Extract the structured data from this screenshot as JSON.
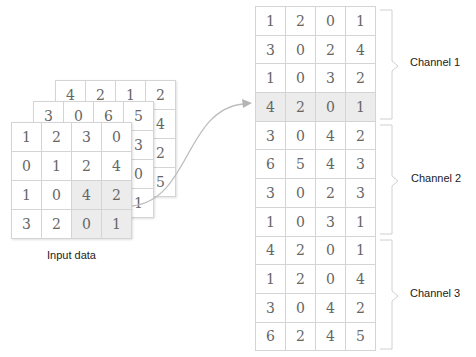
{
  "input": {
    "caption": "Input data",
    "layers": [
      {
        "name": "channel-3",
        "rows": [
          [
            "4",
            "2",
            "1",
            "2"
          ],
          [
            "",
            "",
            "",
            "4"
          ],
          [
            "",
            "",
            "",
            "2"
          ],
          [
            "",
            "",
            "",
            "5"
          ]
        ]
      },
      {
        "name": "channel-2",
        "rows": [
          [
            "3",
            "0",
            "6",
            "5"
          ],
          [
            "",
            "",
            "",
            "3"
          ],
          [
            "",
            "",
            "",
            "0"
          ],
          [
            "",
            "",
            "",
            "1"
          ]
        ]
      },
      {
        "name": "channel-1",
        "rows": [
          [
            "1",
            "2",
            "3",
            "0"
          ],
          [
            "0",
            "1",
            "2",
            "4"
          ],
          [
            "1",
            "0",
            "4",
            "2"
          ],
          [
            "3",
            "2",
            "0",
            "1"
          ]
        ]
      }
    ]
  },
  "output": {
    "rows": [
      [
        "1",
        "2",
        "0",
        "1"
      ],
      [
        "3",
        "0",
        "2",
        "4"
      ],
      [
        "1",
        "0",
        "3",
        "2"
      ],
      [
        "4",
        "2",
        "0",
        "1"
      ],
      [
        "3",
        "0",
        "4",
        "2"
      ],
      [
        "6",
        "5",
        "4",
        "3"
      ],
      [
        "3",
        "0",
        "2",
        "3"
      ],
      [
        "1",
        "0",
        "3",
        "1"
      ],
      [
        "4",
        "2",
        "0",
        "1"
      ],
      [
        "1",
        "2",
        "0",
        "4"
      ],
      [
        "3",
        "0",
        "4",
        "2"
      ],
      [
        "6",
        "2",
        "4",
        "5"
      ]
    ],
    "highlighted_row": 3
  },
  "channels": [
    {
      "label": "Channel 1"
    },
    {
      "label": "Channel 2"
    },
    {
      "label": "Channel 3"
    }
  ],
  "colors": {
    "grid_line": "#d4d4d4",
    "highlight": "#ececec",
    "arrow": "#bdbdbd",
    "brace": "#d0d0d0"
  }
}
